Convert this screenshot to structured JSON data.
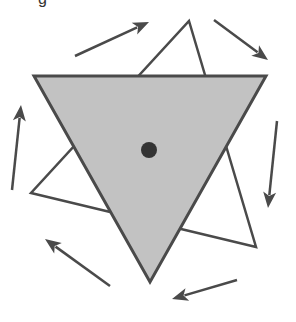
{
  "diagram": {
    "top_text_fragment": "g",
    "colors": {
      "stroke": "#4a4a4a",
      "gray_fill": "#c2c2c2",
      "white_fill": "#ffffff",
      "dot": "#333333",
      "arrow": "#4a4a4a",
      "background": "#ffffff"
    },
    "shapes": {
      "gray_triangle": {
        "name": "original-triangle",
        "points": "34,76 266,76 150,282"
      },
      "white_triangle": {
        "name": "rotated-triangle",
        "points": "189,21 256,247 31,193"
      },
      "center_dot": {
        "name": "center-of-rotation",
        "cx": 149,
        "cy": 150,
        "r": 8
      }
    },
    "rotation_direction": "clockwise",
    "arrows": [
      {
        "name": "arrow-top-left",
        "x1": 75,
        "y1": 56,
        "x2": 149,
        "y2": 22
      },
      {
        "name": "arrow-top-right",
        "x1": 214,
        "y1": 20,
        "x2": 268,
        "y2": 60
      },
      {
        "name": "arrow-right",
        "x1": 277,
        "y1": 121,
        "x2": 268,
        "y2": 208
      },
      {
        "name": "arrow-bottom-right",
        "x1": 237,
        "y1": 280,
        "x2": 172,
        "y2": 299
      },
      {
        "name": "arrow-bottom-left",
        "x1": 110,
        "y1": 286,
        "x2": 45,
        "y2": 239
      },
      {
        "name": "arrow-left",
        "x1": 12,
        "y1": 190,
        "x2": 21,
        "y2": 105
      }
    ]
  }
}
